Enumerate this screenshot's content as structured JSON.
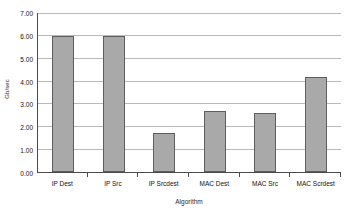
{
  "chart_data": {
    "type": "bar",
    "title": "",
    "categories": [
      "IP Dest",
      "IP Src",
      "IP Srcdest",
      "MAC Dest",
      "MAC Src",
      "MAC Scrdest"
    ],
    "values": [
      6.0,
      6.0,
      1.7,
      2.67,
      2.58,
      4.17
    ],
    "series": [
      {
        "name": "Gb/sec",
        "values": [
          6.0,
          6.0,
          1.7,
          2.67,
          2.58,
          4.17
        ]
      }
    ],
    "xlabel": "Algorithm",
    "ylabel": "Gb/sec",
    "ylim": [
      0.0,
      7.0
    ],
    "ytick_step": 1.0,
    "ytick_labels": [
      "0.00",
      "1.00",
      "2.00",
      "3.00",
      "4.00",
      "5.00",
      "6.00",
      "7.00"
    ],
    "ytick_values": [
      0,
      1,
      2,
      3,
      4,
      5,
      6,
      7
    ],
    "grid": true,
    "grid_axis": "y",
    "legend": false,
    "legend_position": "none",
    "bar_fill_color": "#a9a9a9",
    "bar_border_color": "#5e5e5e",
    "gridline_color": "#b9b9b9",
    "axis_color": "#4a4a4a",
    "background_color": "#ffffff"
  }
}
